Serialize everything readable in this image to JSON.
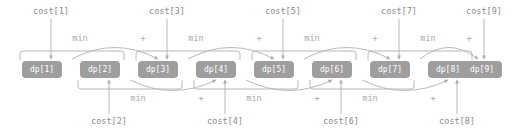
{
  "diagram": {
    "colors": {
      "node_fill": "#9e9e9e",
      "node_text": "#ffffff",
      "line": "#b8b8b8",
      "label_text": "#8a8a8a",
      "op_text": "#a8a8a8",
      "background": "#ffffff"
    },
    "nodes": [
      {
        "label": "dp[1]",
        "x": 22,
        "y": 61
      },
      {
        "label": "dp[2]",
        "x": 80,
        "y": 61
      },
      {
        "label": "dp[3]",
        "x": 138,
        "y": 61
      },
      {
        "label": "dp[4]",
        "x": 196,
        "y": 61
      },
      {
        "label": "dp[5]",
        "x": 254,
        "y": 61
      },
      {
        "label": "dp[6]",
        "x": 312,
        "y": 61
      },
      {
        "label": "dp[7]",
        "x": 370,
        "y": 61
      },
      {
        "label": "dp[8]",
        "x": 428,
        "y": 61
      },
      {
        "label": "dp[9]",
        "x": 462,
        "y": 61
      }
    ],
    "cost_labels_top": [
      {
        "label": "cost[1]",
        "cx": 51,
        "y": 6,
        "arrow_to_x": 51,
        "arrow_to_y": 59
      },
      {
        "label": "cost[3]",
        "cx": 167,
        "y": 6,
        "arrow_to_x": 167,
        "arrow_to_y": 59
      },
      {
        "label": "cost[5]",
        "cx": 283,
        "y": 6,
        "arrow_to_x": 283,
        "arrow_to_y": 59
      },
      {
        "label": "cost[7]",
        "cx": 399,
        "y": 6,
        "arrow_to_x": 399,
        "arrow_to_y": 59
      },
      {
        "label": "cost[9]",
        "cx": 484,
        "y": 6,
        "arrow_to_x": 484,
        "arrow_to_y": 59
      }
    ],
    "cost_labels_bottom": [
      {
        "label": "cost[2]",
        "cx": 109,
        "y": 116,
        "arrow_to_x": 109,
        "arrow_to_y": 80
      },
      {
        "label": "cost[4]",
        "cx": 225,
        "y": 116,
        "arrow_to_x": 225,
        "arrow_to_y": 80
      },
      {
        "label": "cost[6]",
        "cx": 341,
        "y": 116,
        "arrow_to_x": 341,
        "arrow_to_y": 80
      },
      {
        "label": "cost[8]",
        "cx": 457,
        "y": 116,
        "arrow_to_x": 457,
        "arrow_to_y": 80
      }
    ],
    "min_labels_top": [
      {
        "label": "min",
        "cx": 80,
        "y": 33
      },
      {
        "label": "min",
        "cx": 196,
        "y": 33
      },
      {
        "label": "min",
        "cx": 312,
        "y": 33
      },
      {
        "label": "min",
        "cx": 428,
        "y": 33
      }
    ],
    "min_labels_bottom": [
      {
        "label": "min",
        "cx": 138,
        "y": 93
      },
      {
        "label": "min",
        "cx": 254,
        "y": 93
      },
      {
        "label": "min",
        "cx": 370,
        "y": 93
      }
    ],
    "plus_labels_top": [
      {
        "label": "+",
        "cx": 143,
        "y": 33
      },
      {
        "label": "+",
        "cx": 259,
        "y": 33
      },
      {
        "label": "+",
        "cx": 375,
        "y": 33
      },
      {
        "label": "+",
        "cx": 469,
        "y": 33
      }
    ],
    "plus_labels_bottom": [
      {
        "label": "+",
        "cx": 201,
        "y": 93
      },
      {
        "label": "+",
        "cx": 317,
        "y": 93
      },
      {
        "label": "+",
        "cx": 433,
        "y": 93
      }
    ],
    "brackets_top": [
      {
        "x": 20,
        "y": 51,
        "w": 104
      },
      {
        "x": 136,
        "y": 51,
        "w": 104
      },
      {
        "x": 252,
        "y": 51,
        "w": 104
      },
      {
        "x": 368,
        "y": 51,
        "w": 104
      }
    ],
    "brackets_bottom": [
      {
        "x": 78,
        "y": 80,
        "w": 104
      },
      {
        "x": 194,
        "y": 80,
        "w": 104
      },
      {
        "x": 310,
        "y": 80,
        "w": 104
      }
    ],
    "arcs_top": [
      {
        "from_x": 72,
        "to_x": 158,
        "base_y": 59,
        "apex_y": 36
      },
      {
        "from_x": 188,
        "to_x": 274,
        "base_y": 59,
        "apex_y": 36
      },
      {
        "from_x": 304,
        "to_x": 390,
        "base_y": 59,
        "apex_y": 36
      },
      {
        "from_x": 420,
        "to_x": 478,
        "base_y": 59,
        "apex_y": 36
      }
    ],
    "arcs_bottom": [
      {
        "from_x": 130,
        "to_x": 216,
        "base_y": 80,
        "apex_y": 101
      },
      {
        "from_x": 246,
        "to_x": 332,
        "base_y": 80,
        "apex_y": 101
      },
      {
        "from_x": 362,
        "to_x": 448,
        "base_y": 80,
        "apex_y": 101
      }
    ]
  }
}
